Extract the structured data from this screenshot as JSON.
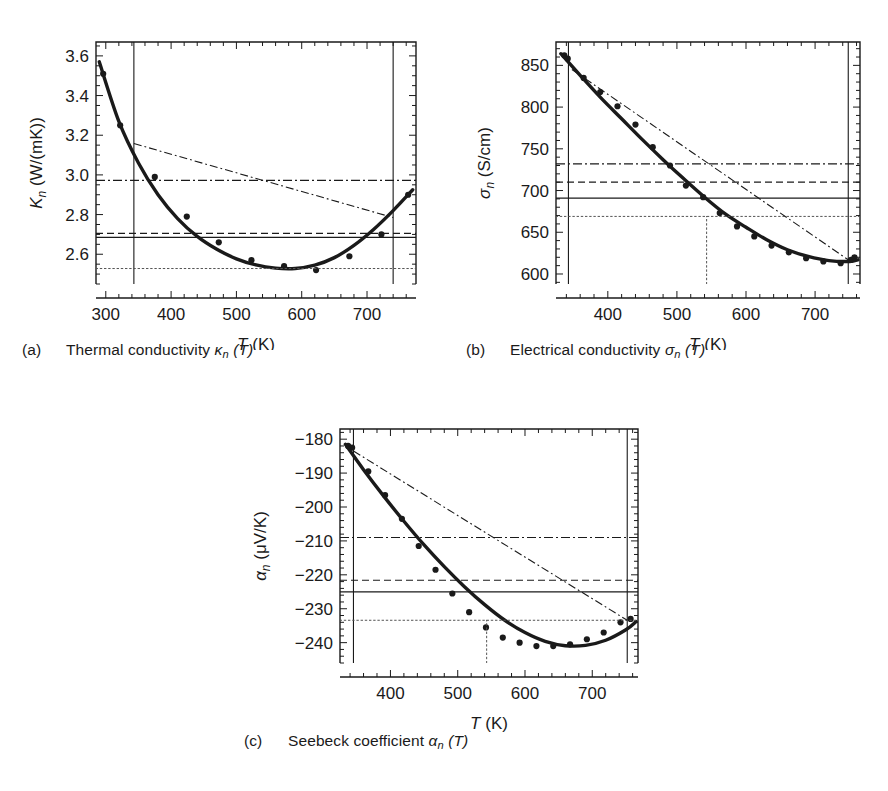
{
  "figure": {
    "background": "#ffffff",
    "ink": "#1a1a1a",
    "panel_count": 3
  },
  "panels": [
    {
      "id": "a",
      "tag": "(a)",
      "caption_prefix": "Thermal conductivity ",
      "caption_symbol": "κ",
      "caption_sub": "n",
      "caption_suffix": " (T)",
      "caption_full": "Thermal conductivity κn (T)"
    },
    {
      "id": "b",
      "tag": "(b)",
      "caption_prefix": "Electrical conductivity ",
      "caption_symbol": "σ",
      "caption_sub": "n",
      "caption_suffix": " (T)",
      "caption_full": "Electrical conductivity σn (T)"
    },
    {
      "id": "c",
      "tag": "(c)",
      "caption_prefix": "Seebeck coefficient ",
      "caption_symbol": "α",
      "caption_sub": "n",
      "caption_suffix": " (T)",
      "caption_full": "Seebeck coefficient αn (T)"
    }
  ],
  "chart_data": [
    {
      "panel": "a",
      "type": "scatter",
      "title": "Thermal conductivity κn (T)",
      "xlabel": "T (K)",
      "ylabel": "Kn (W/(mK))",
      "ylabel_symbol": "K",
      "ylabel_sub": "n",
      "ylabel_units": "(W/(mK))",
      "xlim": [
        285,
        775
      ],
      "ylim": [
        2.45,
        3.67
      ],
      "xticks": [
        300,
        400,
        500,
        600,
        700
      ],
      "xticklabels": [
        "300",
        "400",
        "500",
        "600",
        "700"
      ],
      "yticks": [
        2.6,
        2.8,
        3.0,
        3.2,
        3.4,
        3.6
      ],
      "yticklabels": [
        "2.6",
        "2.8",
        "3.0",
        "3.2",
        "3.4",
        "3.6"
      ],
      "x_minor_step": 20,
      "y_minor_step": 0.05,
      "grid": false,
      "legend": "none",
      "series": [
        {
          "name": "measured-data-points",
          "style": "markers",
          "x": [
            296,
            322,
            375,
            424,
            473,
            523,
            573,
            622,
            673,
            722,
            763
          ],
          "y": [
            3.51,
            3.25,
            2.99,
            2.79,
            2.66,
            2.57,
            2.54,
            2.52,
            2.59,
            2.7,
            2.9
          ]
        },
        {
          "name": "fitted-curve",
          "style": "thick-solid",
          "fit": "quadratic",
          "x": [
            290,
            320,
            350,
            380,
            410,
            440,
            470,
            500,
            530,
            560,
            590,
            620,
            650,
            680,
            710,
            740,
            770
          ],
          "y": [
            3.57,
            3.27,
            3.06,
            2.9,
            2.78,
            2.69,
            2.625,
            2.577,
            2.546,
            2.53,
            2.528,
            2.545,
            2.583,
            2.645,
            2.725,
            2.82,
            2.925
          ]
        },
        {
          "name": "mean-value-line-solid",
          "style": "solid-thin-horizontal",
          "value": 2.685
        },
        {
          "name": "mean-value-line-dashed",
          "style": "dashed-horizontal",
          "value": 2.705
        },
        {
          "name": "mean-value-line-dashdot",
          "style": "dashdot-horizontal",
          "value": 2.972
        },
        {
          "name": "mean-value-line-dotted",
          "style": "dotted-horizontal",
          "value": 2.528
        },
        {
          "name": "secant-line-dashdot",
          "style": "dashdot-slanted",
          "x": [
            343,
            740
          ],
          "y": [
            3.158,
            2.785
          ]
        }
      ],
      "interval_markers": {
        "left_bound": 343,
        "right_bound": 740,
        "style": "solid-thin-vertical"
      }
    },
    {
      "panel": "b",
      "type": "scatter",
      "title": "Electrical conductivity σn (T)",
      "xlabel": "T (K)",
      "ylabel": "σn (S/cm)",
      "ylabel_symbol": "σ",
      "ylabel_sub": "n",
      "ylabel_units": "(S/cm)",
      "xlim": [
        325,
        765
      ],
      "ylim": [
        588,
        878
      ],
      "xticks": [
        400,
        500,
        600,
        700
      ],
      "xticklabels": [
        "400",
        "500",
        "600",
        "700"
      ],
      "yticks": [
        600,
        650,
        700,
        750,
        800,
        850
      ],
      "yticklabels": [
        "600",
        "650",
        "700",
        "750",
        "800",
        "850"
      ],
      "x_minor_step": 20,
      "y_minor_step": 10,
      "grid": false,
      "legend": "none",
      "series": [
        {
          "name": "measured-data-points",
          "style": "markers",
          "x": [
            337,
            342,
            365,
            389,
            414,
            440,
            465,
            490,
            513,
            538,
            562,
            587,
            612,
            637,
            662,
            687,
            712,
            737,
            752,
            757
          ],
          "y": [
            862,
            858,
            835,
            818,
            801,
            779,
            752,
            730,
            706,
            692,
            673,
            657,
            645,
            634,
            626,
            619,
            615,
            613,
            617,
            620
          ]
        },
        {
          "name": "fitted-curve",
          "style": "thick-solid",
          "fit": "quadratic",
          "x": [
            332,
            360,
            390,
            420,
            450,
            480,
            510,
            540,
            570,
            600,
            630,
            660,
            690,
            720,
            750,
            762
          ],
          "y": [
            864,
            838,
            811,
            786,
            761,
            737,
            714,
            692,
            672,
            656,
            641,
            629,
            621,
            616,
            615,
            617
          ]
        },
        {
          "name": "mean-value-line-solid",
          "style": "solid-thin-horizontal",
          "value": 691
        },
        {
          "name": "mean-value-line-dashed",
          "style": "dashed-horizontal",
          "value": 710
        },
        {
          "name": "mean-value-line-dashdot",
          "style": "dashdot-horizontal",
          "value": 732
        },
        {
          "name": "mean-value-line-dotted",
          "style": "dotted-horizontal",
          "value": 669
        },
        {
          "name": "secant-line-dashdot",
          "style": "dashdot-slanted",
          "x": [
            348,
            748
          ],
          "y": [
            845,
            617
          ]
        },
        {
          "name": "dropline-dotted-vertical",
          "style": "dotted-vertical",
          "x": 543,
          "y_from": 588,
          "y_to": 669
        }
      ],
      "interval_markers": {
        "left_bound": 343,
        "right_bound": 748,
        "style": "solid-thin-vertical"
      }
    },
    {
      "panel": "c",
      "type": "scatter",
      "title": "Seebeck coefficient αn (T)",
      "xlabel": "T (K)",
      "ylabel": "αn (μV/K)",
      "ylabel_symbol": "α",
      "ylabel_sub": "n",
      "ylabel_units": "(μV/K)",
      "xlim": [
        325,
        768
      ],
      "ylim": [
        -246,
        -177
      ],
      "xticks": [
        400,
        500,
        600,
        700
      ],
      "xticklabels": [
        "400",
        "500",
        "600",
        "700"
      ],
      "yticks": [
        -240,
        -230,
        -220,
        -210,
        -200,
        -190,
        -180
      ],
      "yticklabels": [
        "−240",
        "−230",
        "−220",
        "−210",
        "−200",
        "−190",
        "−180"
      ],
      "x_minor_step": 20,
      "y_minor_step": 2,
      "grid": false,
      "legend": "none",
      "series": [
        {
          "name": "measured-data-points",
          "style": "markers",
          "x": [
            337,
            343,
            367,
            392,
            417,
            442,
            467,
            492,
            517,
            542,
            567,
            592,
            617,
            642,
            667,
            692,
            717,
            742,
            757
          ],
          "y": [
            -182.0,
            -182.5,
            -189.5,
            -196.5,
            -203.5,
            -211.5,
            -218.5,
            -225.5,
            -231.0,
            -235.5,
            -238.5,
            -240.0,
            -241.0,
            -241.0,
            -240.5,
            -239.0,
            -237.0,
            -234.0,
            -233.0
          ]
        },
        {
          "name": "fitted-curve",
          "style": "thick-solid",
          "fit": "quadratic",
          "x": [
            333,
            360,
            390,
            420,
            450,
            480,
            510,
            540,
            570,
            600,
            630,
            660,
            690,
            720,
            750,
            765
          ],
          "y": [
            -181.5,
            -189.0,
            -196.8,
            -204.2,
            -211.2,
            -217.6,
            -223.5,
            -228.8,
            -233.4,
            -237.0,
            -239.6,
            -240.9,
            -240.8,
            -239.3,
            -236.2,
            -233.8
          ]
        },
        {
          "name": "mean-value-line-solid",
          "style": "solid-thin-horizontal",
          "value": -225.0
        },
        {
          "name": "mean-value-line-dashed",
          "style": "dashed-horizontal",
          "value": -221.6
        },
        {
          "name": "mean-value-line-dashdot",
          "style": "dashdot-horizontal",
          "value": -209.0
        },
        {
          "name": "mean-value-line-dotted",
          "style": "dotted-horizontal",
          "value": -233.4
        },
        {
          "name": "secant-line-dashdot",
          "style": "dashdot-slanted",
          "x": [
            345,
            752
          ],
          "y": [
            -183.5,
            -233.4
          ]
        },
        {
          "name": "dropline-dotted-vertical",
          "style": "dotted-vertical",
          "x": 543,
          "y_from": -246,
          "y_to": -233.4
        }
      ],
      "interval_markers": {
        "left_bound": 345,
        "right_bound": 752,
        "style": "solid-thin-vertical"
      }
    }
  ],
  "axis_labels": {
    "x_common": "T (K)",
    "x_common_italic": "T",
    "x_common_unit": "(K)"
  }
}
